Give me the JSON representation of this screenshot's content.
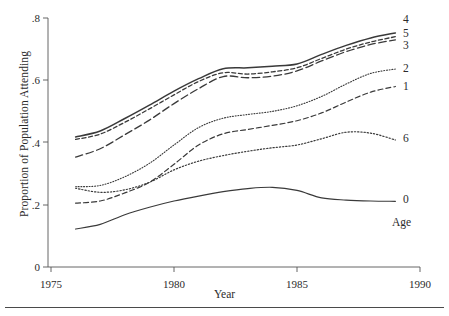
{
  "axes": {
    "y_title": "Proportion of Population Attending",
    "x_title": "Year",
    "y_ticks": [
      "0",
      ".2",
      ".4",
      ".6",
      ".8"
    ],
    "x_ticks": [
      "1975",
      "1980",
      "1985",
      "1990"
    ]
  },
  "legend": {
    "title": "Age",
    "labels": [
      "4",
      "5",
      "3",
      "2",
      "1",
      "6",
      "0"
    ]
  },
  "chart_data": {
    "type": "line",
    "title": "",
    "xlabel": "Year",
    "ylabel": "Proportion of Population Attending",
    "xlim": [
      1975,
      1990
    ],
    "ylim": [
      0,
      0.8
    ],
    "yticks": [
      0,
      0.2,
      0.4,
      0.6,
      0.8
    ],
    "ytick_labels": [
      "0",
      ".2",
      ".4",
      ".6",
      ".8"
    ],
    "xticks": [
      1975,
      1980,
      1985,
      1990
    ],
    "xtick_labels": [
      "1975",
      "1980",
      "1985",
      "1990"
    ],
    "grid": false,
    "legend_position": "right-outside",
    "legend_title": "Age",
    "x": [
      1976,
      1977,
      1978,
      1979,
      1980,
      1981,
      1982,
      1983,
      1984,
      1985,
      1986,
      1987,
      1988,
      1989
    ],
    "series": [
      {
        "name": "4",
        "label": "4",
        "style": "solid",
        "width": 1.5,
        "values": [
          0.418,
          0.437,
          0.477,
          0.52,
          0.565,
          0.605,
          0.637,
          0.64,
          0.645,
          0.652,
          0.683,
          0.712,
          0.736,
          0.752
        ]
      },
      {
        "name": "5",
        "label": "5",
        "style": "dash-short",
        "width": 1.3,
        "values": [
          0.41,
          0.427,
          0.465,
          0.508,
          0.553,
          0.596,
          0.624,
          0.62,
          0.627,
          0.64,
          0.67,
          0.7,
          0.723,
          0.74
        ]
      },
      {
        "name": "3",
        "label": "3",
        "style": "dash-long",
        "width": 1.3,
        "values": [
          0.353,
          0.38,
          0.425,
          0.472,
          0.525,
          0.573,
          0.612,
          0.608,
          0.613,
          0.63,
          0.662,
          0.692,
          0.715,
          0.73
        ]
      },
      {
        "name": "2",
        "label": "2",
        "style": "dot-fine",
        "width": 1.1,
        "values": [
          0.258,
          0.262,
          0.29,
          0.333,
          0.392,
          0.448,
          0.478,
          0.49,
          0.5,
          0.518,
          0.548,
          0.588,
          0.622,
          0.636
        ]
      },
      {
        "name": "1",
        "label": "1",
        "style": "dash-medium",
        "width": 1.2,
        "values": [
          0.205,
          0.212,
          0.238,
          0.272,
          0.33,
          0.392,
          0.428,
          0.442,
          0.455,
          0.47,
          0.495,
          0.53,
          0.562,
          0.58
        ]
      },
      {
        "name": "6",
        "label": "6",
        "style": "dot-round",
        "width": 1.2,
        "values": [
          0.253,
          0.24,
          0.248,
          0.272,
          0.312,
          0.34,
          0.358,
          0.372,
          0.383,
          0.392,
          0.412,
          0.433,
          0.43,
          0.408
        ]
      },
      {
        "name": "0",
        "label": "0",
        "style": "solid",
        "width": 1.2,
        "values": [
          0.122,
          0.137,
          0.168,
          0.192,
          0.212,
          0.228,
          0.242,
          0.252,
          0.256,
          0.246,
          0.222,
          0.215,
          0.212,
          0.211
        ]
      }
    ]
  }
}
